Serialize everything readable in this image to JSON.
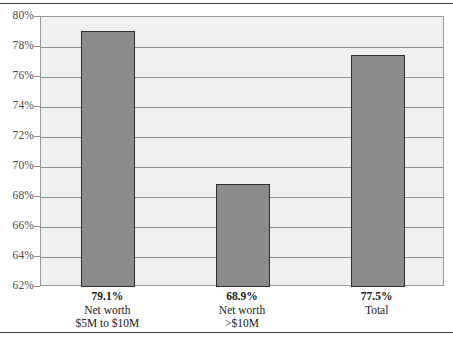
{
  "chart_data": {
    "type": "bar",
    "title": "",
    "subtitle": "",
    "xlabel": "",
    "ylabel": "",
    "ylim": [
      62,
      80
    ],
    "ytick_step": 2,
    "ytick_labels": [
      "80%",
      "78%",
      "76%",
      "74%",
      "72%",
      "70%",
      "68%",
      "66%",
      "64%",
      "62%"
    ],
    "ytick_values": [
      80,
      78,
      76,
      74,
      72,
      70,
      68,
      66,
      64,
      62
    ],
    "grid": true,
    "legend": "none",
    "categories": [
      "Net worth $5M to $10M",
      "Net worth >$10M",
      "Total"
    ],
    "values": [
      79.1,
      68.9,
      77.5
    ],
    "value_labels": [
      "79.1%",
      "68.9%",
      "77.5%"
    ],
    "bars": [
      {
        "value": 79.1,
        "value_label": "79.1%",
        "category_line1": "Net worth",
        "category_line2": "$5M to $10M"
      },
      {
        "value": 68.9,
        "value_label": "68.9%",
        "category_line1": "Net worth",
        "category_line2": ">$10M"
      },
      {
        "value": 77.5,
        "value_label": "77.5%",
        "category_line1": "Total",
        "category_line2": ""
      }
    ],
    "colors": {
      "bar_fill": "#8c8c8c",
      "bar_border": "#2e2e2e",
      "plot_background": "#f0f0f0",
      "gridline": "#8f8f8f",
      "axis_text": "#4a4a4a",
      "label_text": "#1a1a1a",
      "rule": "#3a3a3a"
    }
  }
}
